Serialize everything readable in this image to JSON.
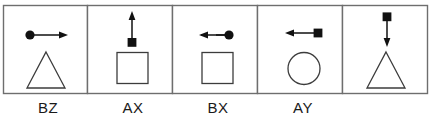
{
  "figure": {
    "panel_count": 5,
    "stroke_color": "#3c3c3c",
    "fill_color": "#111111",
    "background_color": "#ffffff",
    "frame_color": "#6e6e6e",
    "label_color": "#1a1a1a"
  },
  "panels": [
    {
      "id": "panel-1",
      "label": "BZ",
      "arrow": {
        "head_type": "circle",
        "head_position": "left",
        "direction": "right",
        "orientation": "horizontal"
      },
      "shape": "triangle"
    },
    {
      "id": "panel-2",
      "label": "AX",
      "arrow": {
        "head_type": "square",
        "head_position": "bottom",
        "direction": "up",
        "orientation": "vertical"
      },
      "shape": "square"
    },
    {
      "id": "panel-3",
      "label": "BX",
      "arrow": {
        "head_type": "circle",
        "head_position": "right",
        "direction": "left",
        "orientation": "horizontal"
      },
      "shape": "square"
    },
    {
      "id": "panel-4",
      "label": "AY",
      "arrow": {
        "head_type": "square",
        "head_position": "right",
        "direction": "left",
        "orientation": "horizontal"
      },
      "shape": "circle"
    },
    {
      "id": "panel-5",
      "label": "",
      "arrow": {
        "head_type": "square",
        "head_position": "top",
        "direction": "down",
        "orientation": "vertical"
      },
      "shape": "triangle"
    }
  ],
  "labels": {
    "items": [
      {
        "text": "BZ",
        "center_x": 48
      },
      {
        "text": "AX",
        "center_x": 133
      },
      {
        "text": "BX",
        "center_x": 218
      },
      {
        "text": "AY",
        "center_x": 303
      }
    ]
  }
}
